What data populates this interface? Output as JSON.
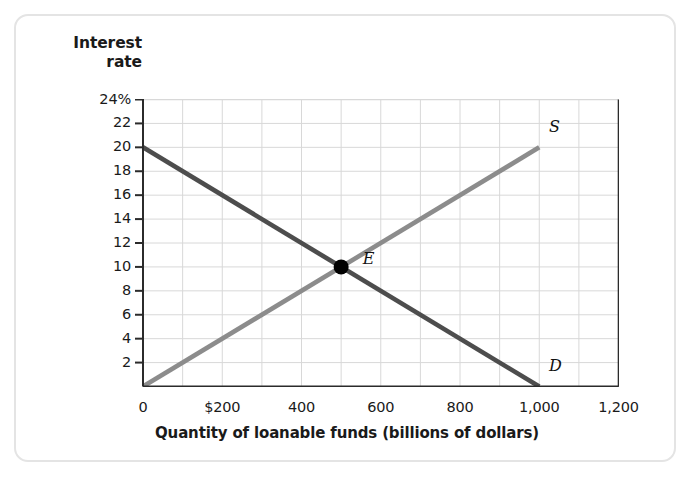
{
  "figure": {
    "y_axis_title_line1": "Interest",
    "y_axis_title_line2": "rate",
    "x_axis_title": "Quantity of loanable funds (billions of dollars)"
  },
  "chart_data": {
    "type": "line",
    "title": "",
    "xlabel": "Quantity of loanable funds (billions of dollars)",
    "ylabel": "Interest rate",
    "xlim": [
      0,
      1200
    ],
    "ylim": [
      0,
      24
    ],
    "grid": true,
    "legend": "none",
    "xticks": [
      0,
      200,
      400,
      600,
      800,
      1000,
      1200
    ],
    "xtick_labels": [
      "0",
      "$200",
      "400",
      "600",
      "800",
      "1,000",
      "1,200"
    ],
    "yticks": [
      2,
      4,
      6,
      8,
      10,
      12,
      14,
      16,
      18,
      20,
      22,
      24
    ],
    "ytick_labels": [
      "2",
      "4",
      "6",
      "8",
      "10",
      "12",
      "14",
      "16",
      "18",
      "20",
      "22",
      "24%"
    ],
    "x_minor_step": 100,
    "y_minor_step": 2,
    "series": [
      {
        "name": "D",
        "label": "D",
        "role": "demand",
        "color": "#4d4d4d",
        "x": [
          0,
          1000
        ],
        "y": [
          20,
          0
        ],
        "label_x": 1040,
        "label_y": 1.6
      },
      {
        "name": "S",
        "label": "S",
        "role": "supply",
        "color": "#8c8c8c",
        "x": [
          0,
          1000
        ],
        "y": [
          0,
          20
        ],
        "label_x": 1040,
        "label_y": 21.6
      }
    ],
    "annotations": [
      {
        "name": "equilibrium",
        "label": "E",
        "x": 500,
        "y": 10,
        "marker": "filled-circle",
        "color": "#000000",
        "label_x": 570,
        "label_y": 10.6
      }
    ]
  },
  "colors": {
    "grid": "#d8d8d8",
    "axis": "#2b2b2b",
    "plot_border_light": "#d8d8d8",
    "demand": "#4d4d4d",
    "supply": "#8c8c8c",
    "frame": "#e4e4e4"
  }
}
